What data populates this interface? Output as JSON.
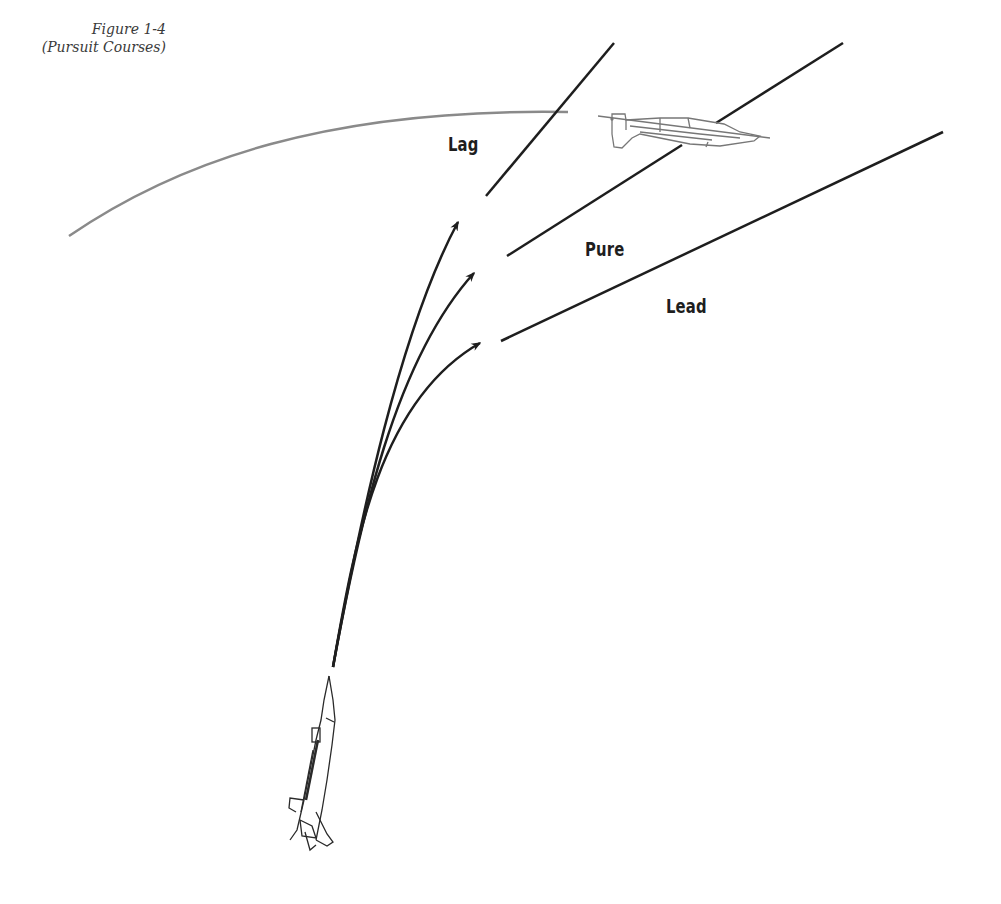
{
  "figure": {
    "number": "Figure 1-4",
    "title": "(Pursuit Courses)"
  },
  "labels": {
    "lag": "Lag",
    "pure": "Pure",
    "lead": "Lead"
  },
  "colors": {
    "lines": "#1e1e1e",
    "target_path": "#8a8a8a",
    "aircraft_outline": "#777777",
    "attacker_outline": "#2a2a2a"
  },
  "elements": {
    "target_aircraft": "target-aircraft-icon",
    "attacker_aircraft": "attacker-aircraft-icon",
    "target_flight_path": "curved flight path",
    "pursuit_arrows": [
      "lag",
      "pure",
      "lead"
    ]
  }
}
